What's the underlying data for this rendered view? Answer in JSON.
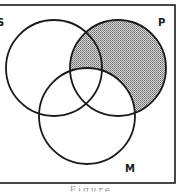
{
  "diagram": {
    "type": "venn",
    "sets": [
      {
        "id": "S",
        "label": "S",
        "cx": 54,
        "cy": 68,
        "r": 48
      },
      {
        "id": "P",
        "label": "P",
        "cx": 118,
        "cy": 68,
        "r": 48
      },
      {
        "id": "M",
        "label": "M",
        "cx": 87,
        "cy": 116,
        "r": 48
      }
    ],
    "shaded_region": "P minus M",
    "colors": {
      "stroke": "#1a1a1a",
      "shade": "#b5b5b5",
      "background": "#ffffff"
    },
    "labels": {
      "s": "S",
      "p": "P",
      "m": "M"
    },
    "caption": "Figure"
  }
}
